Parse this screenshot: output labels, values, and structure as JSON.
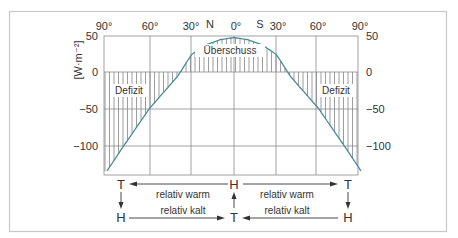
{
  "chart_data": {
    "type": "line",
    "title": "",
    "xlabel": "",
    "ylabel": "[W·m⁻²]",
    "ylim": [
      -138,
      50
    ],
    "grid": true,
    "x_ticks": [
      "90°",
      "60°",
      "30°",
      "0°",
      "30°",
      "60°",
      "90°"
    ],
    "hemisphere_labels": {
      "north": "N",
      "south": "S"
    },
    "y_ticks_left": [
      "50",
      "0",
      "−50",
      "−100"
    ],
    "y_ticks_right": [
      "50",
      "0",
      "−50",
      "−100"
    ],
    "x": [
      -90,
      -80,
      -70,
      -60,
      -50,
      -40,
      -38,
      -30,
      -20,
      -10,
      0,
      10,
      20,
      30,
      38,
      40,
      50,
      60,
      70,
      80,
      90
    ],
    "series": [
      {
        "name": "Strahlungsbilanz",
        "color": "#4a8c9c",
        "values": [
          -135,
          -106,
          -78,
          -50,
          -28,
          -6,
          0,
          24,
          37,
          44,
          47,
          44,
          37,
          24,
          0,
          -6,
          -28,
          -50,
          -78,
          -106,
          -135
        ]
      }
    ],
    "annotations": [
      {
        "text": "Überschuss",
        "region": "positive, 38°N–38°S"
      },
      {
        "text": "Defizit",
        "region": "negative, 38°N–90°N"
      },
      {
        "text": "Defizit",
        "region": "negative, 38°S–90°S"
      }
    ]
  },
  "labels": {
    "ylabel": "[W·m⁻²]",
    "surplus": "Überschuss",
    "deficit_left": "Defizit",
    "deficit_right": "Defizit",
    "north": "N",
    "south": "S",
    "xt0": "90°",
    "xt1": "60°",
    "xt2": "30°",
    "xt3": "0°",
    "xt4": "30°",
    "xt5": "60°",
    "xt6": "90°",
    "yl0": "50",
    "yl1": "0",
    "yl2": "−50",
    "yl3": "−100",
    "yr0": "50",
    "yr1": "0",
    "yr2": "−50",
    "yr3": "−100"
  },
  "circulation": {
    "left_top": "T",
    "left_bottom": "H",
    "center_top": "H",
    "center_bottom": "T",
    "right_top": "T",
    "right_bottom": "H",
    "warm_left": "relativ warm",
    "warm_right": "relativ warm",
    "cold_left": "relativ kalt",
    "cold_right": "relativ kalt"
  }
}
